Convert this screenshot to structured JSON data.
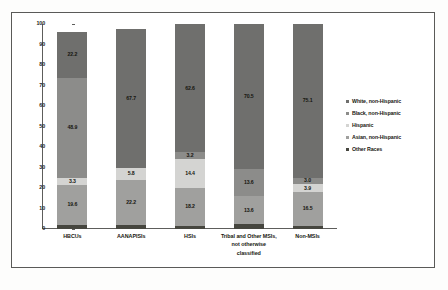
{
  "chart_data": {
    "type": "bar",
    "subtype": "stacked-100-percent",
    "title": "",
    "xlabel": "",
    "ylabel": "",
    "ylim": [
      0,
      100
    ],
    "yticks": [
      100,
      90,
      80,
      70,
      60,
      50,
      40,
      30,
      20,
      10,
      0
    ],
    "grid": false,
    "legend_position": "right",
    "categories": [
      "HBCUs",
      "AANAPISIs",
      "HSIs",
      "Tribal and Other MSIs, not otherwise classified",
      "Non-MSIs"
    ],
    "series": [
      {
        "name": "White, non-Hispanic",
        "color": "#6f6f6d",
        "values": [
          22.2,
          67.7,
          62.6,
          70.5,
          75.1
        ],
        "labels": [
          "22.2",
          "67.7",
          "62.6",
          "70.5",
          "75.1"
        ]
      },
      {
        "name": "Black, non-Hispanic",
        "color": "#8c8c8a",
        "values": [
          48.9,
          0,
          3.2,
          13.6,
          3.0
        ],
        "labels": [
          "48.9",
          "",
          "3.2",
          "13.6",
          "3.0"
        ]
      },
      {
        "name": "Hispanic",
        "color": "#d4d4d2",
        "values": [
          3.3,
          5.8,
          14.4,
          0,
          3.9
        ],
        "labels": [
          "3.3",
          "5.8",
          "14.4",
          "",
          "3.9"
        ]
      },
      {
        "name": "Asian, non-Hispanic",
        "color": "#a0a09e",
        "values": [
          19.6,
          22.2,
          18.2,
          13.6,
          16.5
        ],
        "labels": [
          "19.6",
          "22.2",
          "18.2",
          "13.6",
          "16.5"
        ]
      },
      {
        "name": "Other Races",
        "color": "#46463f",
        "values": [
          2.0,
          1.8,
          1.6,
          2.3,
          1.5
        ],
        "labels": [
          "",
          "",
          "",
          "",
          ""
        ]
      }
    ],
    "legend_entries": [
      {
        "label": "White, non-Hispanic",
        "color": "#6f6f6d"
      },
      {
        "label": "Black, non-Hispanic",
        "color": "#8c8c8a"
      },
      {
        "label": "Hispanic",
        "color": "#d4d4d2"
      },
      {
        "label": "Asian, non-Hispanic",
        "color": "#a0a09e"
      },
      {
        "label": "Other Races",
        "color": "#46463f"
      }
    ],
    "stacks": [
      {
        "category": "HBCUs",
        "segments": [
          {
            "series": "White, non-Hispanic",
            "value": 22.2,
            "label": "22.2",
            "color": "#6f6f6d"
          },
          {
            "series": "Black, non-Hispanic",
            "value": 48.9,
            "label": "48.9",
            "color": "#8c8c8a"
          },
          {
            "series": "Hispanic",
            "value": 3.3,
            "label": "3.3",
            "color": "#d4d4d2"
          },
          {
            "series": "Asian, non-Hispanic",
            "value": 19.6,
            "label": "19.6",
            "color": "#a0a09e"
          },
          {
            "series": "Other Races",
            "value": 2.0,
            "label": "",
            "color": "#46463f"
          }
        ]
      },
      {
        "category": "AANAPISIs",
        "segments": [
          {
            "series": "White, non-Hispanic",
            "value": 67.7,
            "label": "67.7",
            "color": "#6f6f6d"
          },
          {
            "series": "Hispanic",
            "value": 5.8,
            "label": "5.8",
            "color": "#d4d4d2"
          },
          {
            "series": "Asian, non-Hispanic",
            "value": 22.2,
            "label": "22.2",
            "color": "#a0a09e"
          },
          {
            "series": "Other Races",
            "value": 1.8,
            "label": "",
            "color": "#46463f"
          }
        ]
      },
      {
        "category": "HSIs",
        "segments": [
          {
            "series": "White, non-Hispanic",
            "value": 62.6,
            "label": "62.6",
            "color": "#6f6f6d"
          },
          {
            "series": "Black, non-Hispanic",
            "value": 3.2,
            "label": "3.2",
            "color": "#8c8c8a"
          },
          {
            "series": "Hispanic",
            "value": 14.4,
            "label": "14.4",
            "color": "#d4d4d2"
          },
          {
            "series": "Asian, non-Hispanic",
            "value": 18.2,
            "label": "18.2",
            "color": "#a0a09e"
          },
          {
            "series": "Other Races",
            "value": 1.6,
            "label": "",
            "color": "#46463f"
          }
        ]
      },
      {
        "category": "Tribal and Other MSIs, not otherwise classified",
        "segments": [
          {
            "series": "White, non-Hispanic",
            "value": 70.5,
            "label": "70.5",
            "color": "#6f6f6d"
          },
          {
            "series": "Black, non-Hispanic",
            "value": 13.6,
            "label": "13.6",
            "color": "#8c8c8a"
          },
          {
            "series": "Asian, non-Hispanic",
            "value": 13.6,
            "label": "13.6",
            "color": "#a0a09e"
          },
          {
            "series": "Other Races",
            "value": 2.3,
            "label": "",
            "color": "#46463f"
          }
        ]
      },
      {
        "category": "Non-MSIs",
        "segments": [
          {
            "series": "White, non-Hispanic",
            "value": 75.1,
            "label": "75.1",
            "color": "#6f6f6d"
          },
          {
            "series": "Black, non-Hispanic",
            "value": 3.0,
            "label": "3.0",
            "color": "#8c8c8a"
          },
          {
            "series": "Hispanic",
            "value": 3.9,
            "label": "3.9",
            "color": "#d4d4d2"
          },
          {
            "series": "Asian, non-Hispanic",
            "value": 16.5,
            "label": "16.5",
            "color": "#a0a09e"
          },
          {
            "series": "Other Races",
            "value": 1.5,
            "label": "",
            "color": "#46463f"
          }
        ]
      }
    ]
  },
  "axis": {
    "y_tick_labels": [
      "100",
      "90",
      "80",
      "70",
      "60",
      "50",
      "40",
      "30",
      "20",
      "10",
      "0"
    ]
  },
  "x_axis_labels": [
    "HBCUs",
    "AANAPISIs",
    "HSIs",
    "Tribal and Other MSIs, not otherwise classified",
    "Non-MSIs"
  ]
}
